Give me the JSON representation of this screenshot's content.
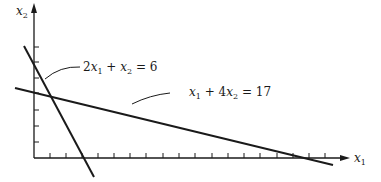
{
  "figure": {
    "type": "linear-programming-constraint-plot",
    "axes": {
      "x_label": "x1",
      "y_label": "x2",
      "x_label_display": "x₁",
      "y_label_display": "x₂",
      "x_ticks_count": 18,
      "y_ticks_count": 7
    },
    "lines": [
      {
        "equation": "2x1 + x2 = 6",
        "display": {
          "coef1": "2",
          "var1": "x",
          "sub1": "1",
          "op": "+",
          "var2": "x",
          "sub2": "2",
          "eq": "=",
          "rhs": "6"
        },
        "x_intercept": 3,
        "y_intercept": 6
      },
      {
        "equation": "x1 + 4x2 = 17",
        "display": {
          "coef1": "",
          "var1": "x",
          "sub1": "1",
          "op": "+",
          "coef2": "4",
          "var2": "x",
          "sub2": "2",
          "eq": "=",
          "rhs": "17"
        },
        "x_intercept": 17,
        "y_intercept": 4.25
      }
    ],
    "colors": {
      "ink": "#1a1a1a",
      "background": "#ffffff"
    }
  }
}
